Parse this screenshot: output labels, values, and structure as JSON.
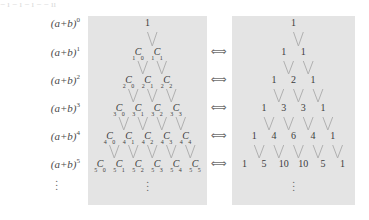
{
  "figure": {
    "top_artifact": "− ı − ı − ı − − ıı",
    "row_labels": [
      {
        "base": "(a+b)",
        "exp": "0"
      },
      {
        "base": "(a+b)",
        "exp": "1"
      },
      {
        "base": "(a+b)",
        "exp": "2"
      },
      {
        "base": "(a+b)",
        "exp": "3"
      },
      {
        "base": "(a+b)",
        "exp": "4"
      },
      {
        "base": "(a+b)",
        "exp": "5"
      }
    ],
    "label_ellipsis": "⋮",
    "arrow_symbol": "⟺",
    "arrow_count": 5,
    "panel_ellipsis": "⋮",
    "colors": {
      "panel_background": "#e4e4e4",
      "page_background": "#ffffff",
      "text": "#3c3c3c",
      "label_text": "#4a4a4a",
      "connector_line": "#b0b0b0",
      "arrow": "#6e6e6e"
    }
  },
  "chart_data": {
    "type": "diagram",
    "panels": [
      {
        "name": "symbolic",
        "notation": "nCr",
        "rows": [
          [
            {
              "text": "1",
              "style": "plain"
            }
          ],
          [
            {
              "n": "1",
              "r": "0"
            },
            {
              "n": "1",
              "r": "1"
            }
          ],
          [
            {
              "n": "2",
              "r": "0"
            },
            {
              "n": "2",
              "r": "1"
            },
            {
              "n": "2",
              "r": "2"
            }
          ],
          [
            {
              "n": "3",
              "r": "0"
            },
            {
              "n": "3",
              "r": "1"
            },
            {
              "n": "3",
              "r": "2"
            },
            {
              "n": "3",
              "r": "3"
            }
          ],
          [
            {
              "n": "4",
              "r": "0"
            },
            {
              "n": "4",
              "r": "1"
            },
            {
              "n": "4",
              "r": "2"
            },
            {
              "n": "4",
              "r": "3"
            },
            {
              "n": "4",
              "r": "4"
            }
          ],
          [
            {
              "n": "5",
              "r": "0"
            },
            {
              "n": "5",
              "r": "1"
            },
            {
              "n": "5",
              "r": "2"
            },
            {
              "n": "5",
              "r": "3"
            },
            {
              "n": "5",
              "r": "4"
            },
            {
              "n": "5",
              "r": "5"
            }
          ]
        ]
      },
      {
        "name": "numeric",
        "rows": [
          [
            "1"
          ],
          [
            "1",
            "1"
          ],
          [
            "1",
            "2",
            "1"
          ],
          [
            "1",
            "3",
            "3",
            "1"
          ],
          [
            "1",
            "4",
            "6",
            "4",
            "1"
          ],
          [
            "1",
            "5",
            "10",
            "10",
            "5",
            "1"
          ]
        ]
      }
    ],
    "connectors": "chevrons joining adjacent entries of row n to the entry below",
    "exponents": [
      "0",
      "1",
      "2",
      "3",
      "4",
      "5"
    ]
  }
}
